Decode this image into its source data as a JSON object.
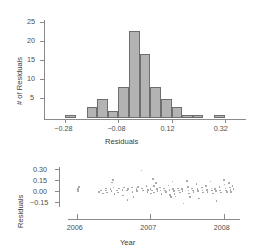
{
  "chart_data": [
    {
      "type": "bar",
      "title": "",
      "xlabel": "Residuals",
      "ylabel": "# of Residuals",
      "xlim": [
        -0.36,
        0.4
      ],
      "ylim": [
        0,
        25
      ],
      "xticks": [
        -0.28,
        -0.08,
        0.12,
        0.32
      ],
      "xticklabels": [
        "−0.28",
        "−0.08",
        "0.12",
        "0.32"
      ],
      "yticks": [
        5,
        10,
        15,
        20,
        25
      ],
      "yticklabels": [
        "5",
        "10",
        "15",
        "20",
        "25"
      ],
      "grid": false,
      "bin_width": 0.04,
      "bin_starts": [
        -0.32,
        -0.28,
        -0.24,
        -0.2,
        -0.16,
        -0.12,
        -0.08,
        -0.04,
        0.0,
        0.04,
        0.08,
        0.12,
        0.16,
        0.2,
        0.24,
        0.28,
        0.32
      ],
      "categories": [
        "-0.32",
        "-0.28",
        "-0.24",
        "-0.20",
        "-0.16",
        "-0.12",
        "-0.08",
        "-0.04",
        "0.00",
        "0.04",
        "0.08",
        "0.12",
        "0.16",
        "0.20",
        "0.24",
        "0.28",
        "0.32"
      ],
      "values": [
        0,
        1,
        0,
        3,
        5,
        2,
        8,
        22.5,
        16.5,
        8,
        5,
        3,
        1,
        1,
        0,
        1,
        0
      ]
    },
    {
      "type": "scatter",
      "title": "",
      "xlabel": "Year",
      "ylabel": "Residuals",
      "xlim": [
        2005.88,
        2008.22
      ],
      "ylim": [
        -0.22,
        0.33
      ],
      "xticks": [
        2006,
        2007,
        2008
      ],
      "xticklabels": [
        "2006",
        "2007",
        "2008"
      ],
      "yticks": [
        -0.15,
        0.0,
        0.15,
        0.3
      ],
      "yticklabels": [
        "−0.15",
        "0.00",
        "0.15",
        "0.30"
      ],
      "grid": false,
      "points": [
        [
          2006.02,
          0.02
        ],
        [
          2006.02,
          -0.01
        ],
        [
          2006.03,
          0.05
        ],
        [
          2006.3,
          -0.02
        ],
        [
          2006.33,
          0.0
        ],
        [
          2006.36,
          -0.04
        ],
        [
          2006.4,
          0.03
        ],
        [
          2006.4,
          0.0
        ],
        [
          2006.41,
          -0.03
        ],
        [
          2006.46,
          0.02
        ],
        [
          2006.47,
          -0.01
        ],
        [
          2006.48,
          0.11
        ],
        [
          2006.49,
          0.14
        ],
        [
          2006.5,
          0.04
        ],
        [
          2006.51,
          -0.05
        ],
        [
          2006.55,
          0.0
        ],
        [
          2006.56,
          -0.03
        ],
        [
          2006.57,
          0.03
        ],
        [
          2006.62,
          0.01
        ],
        [
          2006.63,
          -0.07
        ],
        [
          2006.64,
          0.04
        ],
        [
          2006.68,
          0.0
        ],
        [
          2006.69,
          -0.13
        ],
        [
          2006.7,
          0.02
        ],
        [
          2006.75,
          0.04
        ],
        [
          2006.76,
          -0.02
        ],
        [
          2006.77,
          -0.09
        ],
        [
          2006.81,
          0.02
        ],
        [
          2006.82,
          -0.01
        ],
        [
          2006.83,
          0.05
        ],
        [
          2006.88,
          0.27
        ],
        [
          2006.89,
          0.03
        ],
        [
          2006.9,
          0.0
        ],
        [
          2006.95,
          0.06
        ],
        [
          2006.96,
          -0.02
        ],
        [
          2006.97,
          0.01
        ],
        [
          2007.0,
          0.02
        ],
        [
          2007.01,
          -0.04
        ],
        [
          2007.02,
          0.0
        ],
        [
          2007.04,
          0.16
        ],
        [
          2007.05,
          0.06
        ],
        [
          2007.05,
          -0.03
        ],
        [
          2007.08,
          0.1
        ],
        [
          2007.09,
          0.02
        ],
        [
          2007.1,
          -0.01
        ],
        [
          2007.13,
          0.04
        ],
        [
          2007.14,
          0.0
        ],
        [
          2007.15,
          -0.05
        ],
        [
          2007.19,
          0.03
        ],
        [
          2007.2,
          0.0
        ],
        [
          2007.21,
          -0.02
        ],
        [
          2007.25,
          0.07
        ],
        [
          2007.26,
          0.01
        ],
        [
          2007.27,
          -0.06
        ],
        [
          2007.28,
          -0.09
        ],
        [
          2007.3,
          0.12
        ],
        [
          2007.31,
          0.02
        ],
        [
          2007.32,
          -0.01
        ],
        [
          2007.33,
          -0.05
        ],
        [
          2007.34,
          -0.08
        ],
        [
          2007.38,
          0.03
        ],
        [
          2007.39,
          0.0
        ],
        [
          2007.4,
          -0.03
        ],
        [
          2007.43,
          0.02
        ],
        [
          2007.44,
          -0.01
        ],
        [
          2007.45,
          -0.18
        ],
        [
          2007.5,
          0.13
        ],
        [
          2007.51,
          0.05
        ],
        [
          2007.52,
          0.0
        ],
        [
          2007.53,
          -0.04
        ],
        [
          2007.54,
          -0.09
        ],
        [
          2007.57,
          0.03
        ],
        [
          2007.58,
          0.0
        ],
        [
          2007.59,
          -0.02
        ],
        [
          2007.63,
          0.09
        ],
        [
          2007.64,
          0.02
        ],
        [
          2007.65,
          -0.01
        ],
        [
          2007.66,
          -0.11
        ],
        [
          2007.7,
          0.04
        ],
        [
          2007.71,
          0.0
        ],
        [
          2007.72,
          -0.03
        ],
        [
          2007.76,
          0.06
        ],
        [
          2007.77,
          0.01
        ],
        [
          2007.78,
          -0.02
        ],
        [
          2007.82,
          0.12
        ],
        [
          2007.83,
          0.03
        ],
        [
          2007.84,
          0.0
        ],
        [
          2007.85,
          -0.04
        ],
        [
          2007.88,
          0.02
        ],
        [
          2007.89,
          -0.01
        ],
        [
          2007.9,
          -0.14
        ],
        [
          2007.94,
          0.05
        ],
        [
          2007.95,
          0.0
        ],
        [
          2007.96,
          -0.03
        ],
        [
          2008.0,
          0.14
        ],
        [
          2008.01,
          0.08
        ],
        [
          2008.02,
          0.03
        ],
        [
          2008.03,
          0.0
        ],
        [
          2008.04,
          -0.02
        ],
        [
          2008.07,
          0.1
        ],
        [
          2008.08,
          0.04
        ],
        [
          2008.09,
          0.01
        ],
        [
          2008.1,
          -0.02
        ],
        [
          2008.12,
          0.06
        ],
        [
          2008.13,
          0.02
        ]
      ]
    }
  ],
  "histogram": {
    "ylabel": "# of Residuals",
    "xlabel": "Residuals",
    "yticklabels": [
      "25",
      "20",
      "15",
      "10",
      "5"
    ],
    "xticklabels": [
      "−0.28",
      "−0.08",
      "0.12",
      "0.32"
    ]
  },
  "scatter": {
    "ylabel": "Residuals",
    "xlabel": "Year",
    "yticklabels": [
      "0.30",
      "0.15",
      "0.00",
      "−0.15"
    ],
    "xticklabels": [
      "2006",
      "2007",
      "2008"
    ]
  },
  "colors": {
    "bar_fill": "#b3b3b3",
    "bar_edge": "#6e6e6e",
    "axis": "#8a8a8a",
    "point": "#9a9a9a",
    "text": "#3d3d3d"
  }
}
